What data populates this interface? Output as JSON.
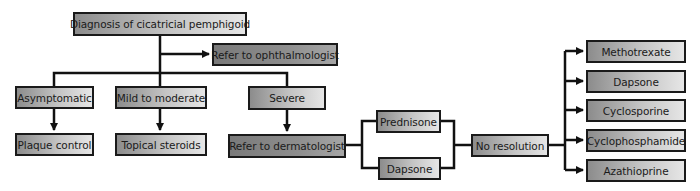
{
  "diagram": {
    "root": "Diagnosis of cicatricial pemphigoid",
    "referral_1": "Refer to ophthalmologist",
    "severity": [
      {
        "label": "Asymptomatic",
        "treatment": "Plaque control"
      },
      {
        "label": "Mild to moderate",
        "treatment": "Topical steroids"
      },
      {
        "label": "Severe",
        "treatment": "Refer to dermatologist"
      }
    ],
    "first_line": [
      "Prednisone",
      "Dapsone"
    ],
    "outcome": "No resolution",
    "second_line": [
      "Methotrexate",
      "Dapsone",
      "Cyclosporine",
      "Cyclophosphamide",
      "Azathioprine"
    ]
  },
  "colors": {
    "border": "#1a1a1a",
    "box_gradient_start": "#8c8c8c",
    "box_gradient_end": "#e6e6e6",
    "referral_box": "#8e8e8e"
  }
}
